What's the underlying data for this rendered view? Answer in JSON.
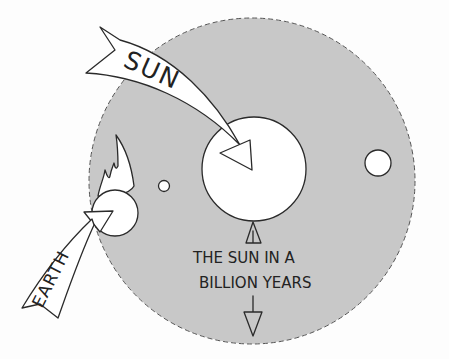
{
  "diagram": {
    "labels": {
      "sun": "SUN",
      "earth": "EARTH",
      "caption_line1": "THE SUN IN A",
      "caption_line2": "BILLION YEARS"
    },
    "colors": {
      "future_sun_fill": "#c8c8c8",
      "planet_fill": "#ffffff",
      "ink": "#2a2a2a",
      "background": "#fdfdfd"
    }
  }
}
